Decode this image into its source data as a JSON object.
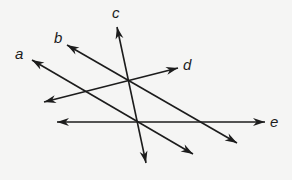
{
  "diagram": {
    "line_color": "#1c1c1c",
    "background_color": "#f5f5f4",
    "lines": [
      {
        "id": "a",
        "label": "a",
        "arrows": "both"
      },
      {
        "id": "b",
        "label": "b",
        "arrows": "both"
      },
      {
        "id": "c",
        "label": "c",
        "arrows": "both"
      },
      {
        "id": "d",
        "label": "d",
        "arrows": "both"
      },
      {
        "id": "e",
        "label": "e",
        "arrows": "both"
      }
    ],
    "intersections": [
      {
        "lines": [
          "b",
          "c",
          "d"
        ]
      },
      {
        "lines": [
          "a",
          "c",
          "e"
        ]
      }
    ]
  }
}
